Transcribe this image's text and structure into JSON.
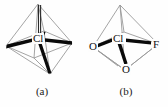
{
  "figure": {
    "background_color": "#fefefe",
    "wireframe_color": "#9a9a9a",
    "bond_color": "#0a0a0a",
    "label_color": "#111111",
    "panels": [
      {
        "id": "a",
        "caption": "(a)",
        "shape": "octahedron",
        "center_label": "Cl",
        "vertex_labels": [
          "",
          "",
          "",
          "",
          "",
          ""
        ],
        "bold_bonds": 4,
        "description_labels": []
      },
      {
        "id": "b",
        "caption": "(b)",
        "shape": "octahedron",
        "center_label": "Cl",
        "vertex_labels": [
          "O",
          "F",
          "O"
        ],
        "bold_bonds": 3,
        "description_labels": [
          {
            "text": "O",
            "position": "left"
          },
          {
            "text": "F",
            "position": "right"
          },
          {
            "text": "O",
            "position": "bottom"
          }
        ]
      }
    ]
  }
}
